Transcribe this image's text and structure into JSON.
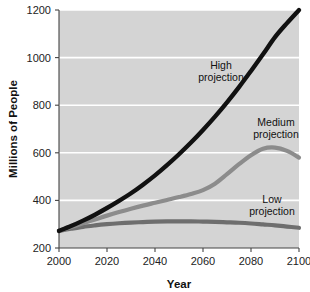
{
  "chart_data": {
    "type": "line",
    "title": "",
    "xlabel": "Year",
    "ylabel": "Millions of People",
    "xlim": [
      2000,
      2100
    ],
    "ylim": [
      200,
      1200
    ],
    "xticks": [
      2000,
      2020,
      2040,
      2060,
      2080,
      2100
    ],
    "xtick_labels": [
      "2000",
      "2020",
      "2040",
      "2060",
      "2080",
      "2100"
    ],
    "yticks": [
      200,
      400,
      600,
      800,
      1000,
      1200
    ],
    "ytick_labels": [
      "200",
      "400",
      "600",
      "800",
      "1000",
      "1200"
    ],
    "grid": "horizontal-white",
    "plot_background": "#d4d4d4",
    "figure_background": "#ffffff",
    "legend": "inline-annotations",
    "x": [
      2000,
      2005,
      2010,
      2015,
      2020,
      2025,
      2030,
      2035,
      2040,
      2045,
      2050,
      2055,
      2060,
      2065,
      2070,
      2075,
      2080,
      2085,
      2090,
      2095,
      2100
    ],
    "series": [
      {
        "name": "High projection",
        "color": "#111111",
        "label_text_line1": "High",
        "label_text_line2": "projection",
        "values": [
          272,
          292,
          315,
          340,
          368,
          398,
          430,
          466,
          505,
          548,
          594,
          643,
          696,
          752,
          812,
          876,
          944,
          1014,
          1086,
          1145,
          1200
        ]
      },
      {
        "name": "Medium projection",
        "color": "#8c8c8c",
        "label_text_line1": "Medium",
        "label_text_line2": "projection",
        "values": [
          272,
          288,
          304,
          320,
          336,
          351,
          365,
          378,
          390,
          402,
          414,
          427,
          443,
          470,
          510,
          552,
          590,
          617,
          622,
          608,
          580
        ]
      },
      {
        "name": "Low projection",
        "color": "#6e6e6e",
        "label_text_line1": "Low",
        "label_text_line2": "projection",
        "values": [
          272,
          281,
          289,
          295,
          300,
          304,
          307,
          309,
          311,
          312,
          312,
          312,
          311,
          310,
          308,
          306,
          303,
          299,
          295,
          290,
          285
        ]
      }
    ]
  },
  "labels": {
    "high_line1": "High",
    "high_line2": "projection",
    "medium_line1": "Medium",
    "medium_line2": "projection",
    "low_line1": "Low",
    "low_line2": "projection",
    "x_axis_title": "Year",
    "y_axis_title": "Millions of People"
  }
}
